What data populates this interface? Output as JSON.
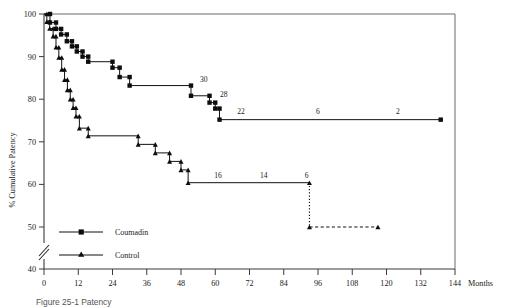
{
  "figure": {
    "caption_fragment": "Figure 25-1  Patency"
  },
  "chart_data": {
    "type": "line",
    "subtype": "kaplan-meier-step",
    "title": "",
    "xlabel": "Months",
    "ylabel": "% Cumulative Patency",
    "xlim": [
      0,
      144
    ],
    "ylim": [
      40,
      100
    ],
    "y_axis_break": {
      "between": [
        40,
        50
      ],
      "symbol": "double-slash"
    },
    "grid": false,
    "legend_position": "bottom-left",
    "x_ticks": [
      0,
      12,
      24,
      36,
      48,
      60,
      72,
      84,
      96,
      108,
      120,
      132,
      144
    ],
    "x_tick_labels": [
      "0",
      "12",
      "24",
      "36",
      "48",
      "60",
      "72",
      "84",
      "96",
      "108",
      "120",
      "132",
      "144"
    ],
    "y_ticks": [
      40,
      50,
      60,
      70,
      80,
      90,
      100
    ],
    "y_tick_labels": [
      "40",
      "50",
      "60",
      "70",
      "80",
      "90",
      "100"
    ],
    "series": [
      {
        "name": "Coumadin",
        "marker": "square",
        "linestyle": "solid",
        "points": [
          {
            "x": 0,
            "y": 100
          },
          {
            "x": 2.1,
            "y": 100
          },
          {
            "x": 2.1,
            "y": 98.0
          },
          {
            "x": 4.2,
            "y": 98.0
          },
          {
            "x": 4.2,
            "y": 96.5
          },
          {
            "x": 6.0,
            "y": 96.5
          },
          {
            "x": 6.0,
            "y": 95.2
          },
          {
            "x": 8.0,
            "y": 95.2
          },
          {
            "x": 8.0,
            "y": 93.6
          },
          {
            "x": 9.8,
            "y": 93.6
          },
          {
            "x": 9.8,
            "y": 92.4
          },
          {
            "x": 11.5,
            "y": 92.4
          },
          {
            "x": 11.5,
            "y": 91.2
          },
          {
            "x": 13.5,
            "y": 91.2
          },
          {
            "x": 13.5,
            "y": 90.0
          },
          {
            "x": 15.5,
            "y": 90.0
          },
          {
            "x": 15.5,
            "y": 88.8
          },
          {
            "x": 24.0,
            "y": 88.8
          },
          {
            "x": 24.0,
            "y": 87.4
          },
          {
            "x": 26.5,
            "y": 87.4
          },
          {
            "x": 26.5,
            "y": 85.2
          },
          {
            "x": 30.0,
            "y": 85.2
          },
          {
            "x": 30.0,
            "y": 83.2
          },
          {
            "x": 51.5,
            "y": 83.2
          },
          {
            "x": 51.5,
            "y": 80.8
          },
          {
            "x": 58.0,
            "y": 80.8
          },
          {
            "x": 58.0,
            "y": 79.2
          },
          {
            "x": 60.0,
            "y": 79.2
          },
          {
            "x": 60.0,
            "y": 77.8
          },
          {
            "x": 61.5,
            "y": 77.8
          },
          {
            "x": 61.5,
            "y": 75.2
          },
          {
            "x": 139.0,
            "y": 75.2
          }
        ],
        "at_risk_labels": [
          {
            "x": 56.0,
            "y": 84.0,
            "text": "30"
          },
          {
            "x": 63.0,
            "y": 80.4,
            "text": "28"
          },
          {
            "x": 69.0,
            "y": 76.6,
            "text": "22"
          },
          {
            "x": 96.0,
            "y": 76.6,
            "text": "6"
          },
          {
            "x": 124.0,
            "y": 76.6,
            "text": "2"
          }
        ]
      },
      {
        "name": "Control",
        "marker": "triangle",
        "linestyle": "solid",
        "points": [
          {
            "x": 0,
            "y": 100
          },
          {
            "x": 1.0,
            "y": 100
          },
          {
            "x": 1.0,
            "y": 98.2
          },
          {
            "x": 2.0,
            "y": 98.2
          },
          {
            "x": 2.0,
            "y": 96.6
          },
          {
            "x": 3.2,
            "y": 96.6
          },
          {
            "x": 3.2,
            "y": 94.8
          },
          {
            "x": 4.2,
            "y": 94.8
          },
          {
            "x": 4.2,
            "y": 92.2
          },
          {
            "x": 5.2,
            "y": 92.2
          },
          {
            "x": 5.2,
            "y": 89.8
          },
          {
            "x": 6.2,
            "y": 89.8
          },
          {
            "x": 6.2,
            "y": 87.0
          },
          {
            "x": 7.2,
            "y": 87.0
          },
          {
            "x": 7.2,
            "y": 84.6
          },
          {
            "x": 8.2,
            "y": 84.6
          },
          {
            "x": 8.2,
            "y": 82.2
          },
          {
            "x": 9.2,
            "y": 82.2
          },
          {
            "x": 9.2,
            "y": 80.0
          },
          {
            "x": 10.2,
            "y": 80.0
          },
          {
            "x": 10.2,
            "y": 78.0
          },
          {
            "x": 11.2,
            "y": 78.0
          },
          {
            "x": 11.2,
            "y": 76.0
          },
          {
            "x": 12.4,
            "y": 76.0
          },
          {
            "x": 12.4,
            "y": 73.2
          },
          {
            "x": 15.5,
            "y": 73.2
          },
          {
            "x": 15.5,
            "y": 71.4
          },
          {
            "x": 33.0,
            "y": 71.4
          },
          {
            "x": 33.0,
            "y": 69.4
          },
          {
            "x": 39.0,
            "y": 69.4
          },
          {
            "x": 39.0,
            "y": 67.4
          },
          {
            "x": 44.0,
            "y": 67.4
          },
          {
            "x": 44.0,
            "y": 65.4
          },
          {
            "x": 48.0,
            "y": 65.4
          },
          {
            "x": 48.0,
            "y": 63.4
          },
          {
            "x": 50.5,
            "y": 63.4
          },
          {
            "x": 50.5,
            "y": 60.4
          },
          {
            "x": 93.0,
            "y": 60.4
          }
        ],
        "at_risk_labels": [
          {
            "x": 61.0,
            "y": 61.6,
            "text": "16"
          },
          {
            "x": 77.0,
            "y": 61.6,
            "text": "14"
          },
          {
            "x": 92.0,
            "y": 61.6,
            "text": "6"
          }
        ],
        "extension": {
          "style": "dotted-drop-then-dashed",
          "drop": {
            "x": 93.0,
            "y_from": 60.4,
            "y_to": 50.0
          },
          "tail": {
            "y": 50.0,
            "x_from": 93.0,
            "x_to": 117.0
          },
          "end_marker": "triangle"
        }
      }
    ],
    "legend": [
      {
        "label": "Coumadin",
        "marker": "square"
      },
      {
        "label": "Control",
        "marker": "triangle"
      }
    ]
  }
}
